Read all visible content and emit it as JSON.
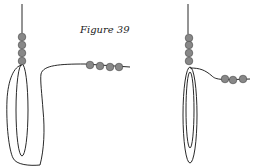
{
  "figure": {
    "caption": "Figure 39",
    "bead_color": "#888888",
    "line_color": "#111111"
  },
  "left_diagram": {
    "vertical_beads": 4,
    "horizontal_beads": 4,
    "description": "thread loop with beads, loose"
  },
  "right_diagram": {
    "vertical_beads": 4,
    "horizontal_beads": 3,
    "description": "thread loop tightened"
  }
}
